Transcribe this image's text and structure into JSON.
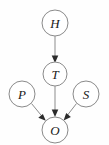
{
  "diagram": {
    "type": "directed-acyclic-graph",
    "title": "",
    "background_color": "#fefefe",
    "node_stroke_color": "#8a8a8a",
    "node_fill_color": "#ffffff",
    "edge_color": "#8c8c8c",
    "arrowhead_color": "#2b2b2b",
    "label_color": "#1a1a1a",
    "nodes": [
      {
        "id": "H",
        "label": "H",
        "cx": 55,
        "cy": 23,
        "r": 13
      },
      {
        "id": "T",
        "label": "T",
        "cx": 55,
        "cy": 74,
        "r": 12
      },
      {
        "id": "P",
        "label": "P",
        "cx": 22,
        "cy": 94,
        "r": 13
      },
      {
        "id": "S",
        "label": "S",
        "cx": 86,
        "cy": 94,
        "r": 13
      },
      {
        "id": "O",
        "label": "O",
        "cx": 55,
        "cy": 130,
        "r": 13
      }
    ],
    "edges": [
      {
        "id": "H-T",
        "from": "H",
        "to": "T",
        "directed": true
      },
      {
        "id": "T-O",
        "from": "T",
        "to": "O",
        "directed": true
      },
      {
        "id": "P-O",
        "from": "P",
        "to": "O",
        "directed": true
      },
      {
        "id": "S-O",
        "from": "S",
        "to": "O",
        "directed": true
      }
    ]
  }
}
